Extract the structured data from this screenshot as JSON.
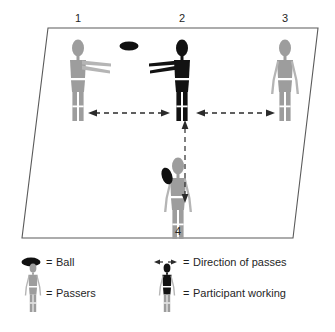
{
  "figure": {
    "court": {
      "name": "court-parallelogram",
      "shape": "parallelogram",
      "stroke": "#5a5a5a"
    },
    "colors": {
      "passer_gray": "#9d9d9d",
      "passer_gray_limb": "#b5b5b5",
      "participant_black": "#121212",
      "ball_black": "#101010",
      "arrow_dark": "#2b2b2b",
      "outline": "#5a5a5a",
      "text": "#1f1f1f"
    },
    "players": [
      {
        "label": "1",
        "name": "player-1",
        "role": "passer",
        "color": "gray",
        "arms": "extended-right",
        "label_x": 78,
        "label_y": 18
      },
      {
        "label": "2",
        "name": "player-2",
        "role": "participant-working",
        "color": "black",
        "arms": "extended-left",
        "label_x": 182,
        "label_y": 18
      },
      {
        "label": "3",
        "name": "player-3",
        "role": "passer",
        "color": "gray",
        "arms": "at-sides",
        "label_x": 285,
        "label_y": 18
      },
      {
        "label": "4",
        "name": "player-4",
        "role": "passer",
        "color": "gray",
        "arms": "at-sides-holding-ball",
        "label_x": 178,
        "label_y": 231
      }
    ],
    "ball": {
      "name": "ball-in-flight",
      "between": [
        "1",
        "2"
      ]
    },
    "arrows": [
      {
        "name": "pass-arrow-1-2",
        "orientation": "horizontal",
        "style": "dashed-double-headed",
        "between": [
          "1",
          "2"
        ]
      },
      {
        "name": "pass-arrow-2-3",
        "orientation": "horizontal",
        "style": "dashed-double-headed",
        "between": [
          "2",
          "3"
        ]
      },
      {
        "name": "pass-arrow-4-2",
        "orientation": "vertical",
        "style": "dashed-double-headed",
        "between": [
          "4",
          "2"
        ]
      }
    ]
  },
  "legend": {
    "name": "legend",
    "items": [
      {
        "key": "ball",
        "icon": "ball-icon",
        "equals": "=",
        "label": "Ball"
      },
      {
        "key": "passers",
        "icon": "passer-figure-icon",
        "equals": "=",
        "label": "Passers"
      },
      {
        "key": "direction",
        "icon": "double-arrow-icon",
        "equals": "=",
        "label": "Direction of passes"
      },
      {
        "key": "participant",
        "icon": "participant-figure-icon",
        "equals": "=",
        "label": "Participant working"
      }
    ]
  }
}
